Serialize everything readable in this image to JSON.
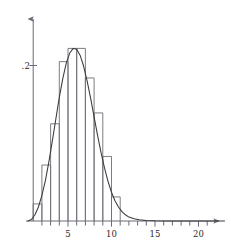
{
  "chart_data": {
    "type": "bar",
    "title": "",
    "subtitle": "",
    "xlabel": "",
    "ylabel": "",
    "xlim": [
      -0.6,
      22.5
    ],
    "ylim": [
      0,
      0.245
    ],
    "grid": false,
    "legend": null,
    "x_tick_labels": [
      "5",
      "10",
      "15",
      "20"
    ],
    "x_tick_values": [
      5,
      10,
      15,
      20
    ],
    "x_minor_tick_step": 1,
    "y_tick_labels": [
      ".2"
    ],
    "y_tick_values": [
      0.2
    ],
    "bin_width": 1,
    "bin_starts": [
      0,
      1,
      2,
      3,
      4,
      5,
      6,
      7,
      8,
      9
    ],
    "categories": [
      "0-1",
      "1-2",
      "2-3",
      "3-4",
      "4-5",
      "5-6",
      "6-7",
      "7-8",
      "8-9",
      "9-10"
    ],
    "values": [
      0.022,
      0.072,
      0.125,
      0.205,
      0.222,
      0.222,
      0.184,
      0.139,
      0.083,
      0.031
    ],
    "series": [
      {
        "name": "histogram",
        "type": "bar",
        "values": [
          0.022,
          0.072,
          0.125,
          0.205,
          0.222,
          0.222,
          0.184,
          0.139,
          0.083,
          0.031
        ]
      },
      {
        "name": "density-curve",
        "type": "line",
        "x": [
          -0.6,
          -0.2,
          0.2,
          0.6,
          1.0,
          1.4,
          1.8,
          2.2,
          2.6,
          3.0,
          3.4,
          3.8,
          4.2,
          4.6,
          5.0,
          5.4,
          5.8,
          6.2,
          6.6,
          7.0,
          7.4,
          7.8,
          8.2,
          8.6,
          9.0,
          9.4,
          9.8,
          10.2,
          10.6,
          11.0,
          11.6,
          12.2,
          13.0,
          14.0,
          15.5,
          17.5,
          20.0,
          22.0
        ],
        "y": [
          0.0,
          0.002,
          0.008,
          0.018,
          0.033,
          0.052,
          0.076,
          0.103,
          0.131,
          0.159,
          0.183,
          0.203,
          0.216,
          0.222,
          0.221,
          0.213,
          0.199,
          0.18,
          0.158,
          0.134,
          0.11,
          0.088,
          0.068,
          0.051,
          0.037,
          0.026,
          0.018,
          0.012,
          0.008,
          0.005,
          0.003,
          0.0015,
          0.0007,
          0.0003,
          0.0001,
          0.0,
          0.0,
          0.0
        ]
      }
    ],
    "colors": {
      "axis": "#6a6a78",
      "bars": "#6e6e78",
      "curve": "#3a3a3a",
      "text": "#2b2b2b",
      "background": "#ffffff"
    }
  }
}
